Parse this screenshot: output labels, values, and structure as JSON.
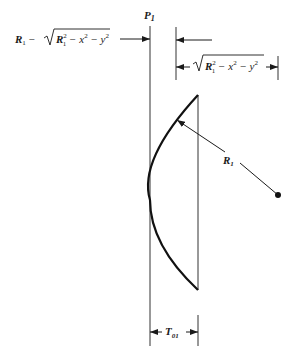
{
  "figure": {
    "type": "lens-geometry-diagram",
    "labels": {
      "plane": "P",
      "plane_sub": "1",
      "sag_expr_left": "R",
      "sag_expr_left_sub": "1",
      "sag_expr_minus": " − ",
      "sqrt_inner_R": "R",
      "sqrt_inner_R_sub": "1",
      "sqrt_inner_R_sup": "2",
      "sqrt_inner_rest": " − x",
      "sqrt_inner_x_sup": "2",
      "sqrt_inner_minus_y": " − y",
      "sqrt_inner_y_sup": "2",
      "radius": "R",
      "radius_sub": "1",
      "thickness": "T",
      "thickness_sub": "01"
    },
    "annotations": [
      "R1 − √(R1² − x² − y²)",
      "√(R1² − x² − y²)",
      "P1",
      "R1",
      "T01"
    ],
    "colors": {
      "stroke": "#1a1a1a",
      "thin_line": "#333333",
      "background": "#ffffff"
    }
  }
}
